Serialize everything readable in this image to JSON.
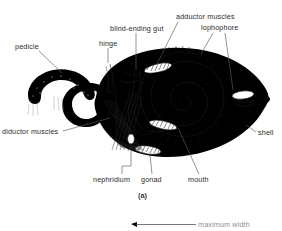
{
  "figure": {
    "caption": "(a)",
    "labels": {
      "pedicle": "pedicle",
      "hinge": "hinge",
      "blind_ending_gut": "blind-ending gut",
      "adductor_muscles": "adductor muscles",
      "lophophore": "lophophore",
      "shell": "shell",
      "mouth": "mouth",
      "gonad": "gonad",
      "nephridium": "nephridium",
      "diductor_muscles": "diductor muscles"
    },
    "partial_lower_figure": {
      "measure_label": "maximum width"
    },
    "colors": {
      "ink": "#000000",
      "label_text": "#2b2b2b",
      "leader_line": "#5a5a5a",
      "background": "#ffffff",
      "faint_text": "#8e8e8e"
    }
  }
}
